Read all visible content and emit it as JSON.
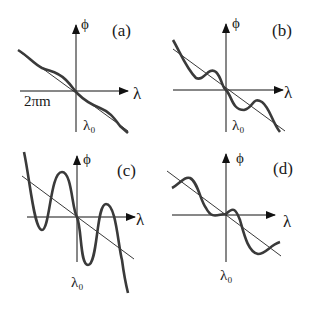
{
  "figure": {
    "panels": [
      {
        "id": "a",
        "tag": "(a)",
        "y_label": "ϕ",
        "x_label": "λ",
        "origin_label": "λ₀",
        "extra_label": "2πm",
        "description": "nearly linear decreasing phase with tiny ripple"
      },
      {
        "id": "b",
        "tag": "(b)",
        "y_label": "ϕ",
        "x_label": "λ",
        "origin_label": "λ₀",
        "description": "decreasing linear trend with moderate oscillation"
      },
      {
        "id": "c",
        "tag": "(c)",
        "y_label": "ϕ",
        "x_label": "λ",
        "origin_label": "λ₀",
        "description": "decreasing linear trend with large-amplitude oscillation"
      },
      {
        "id": "d",
        "tag": "(d)",
        "y_label": "ϕ",
        "x_label": "λ",
        "origin_label": "λ₀",
        "description": "decreasing linear trend with oscillation, flat at ends"
      }
    ],
    "colors": {
      "curve": "#3a3a3a",
      "line": "#1a1a1a",
      "axis": "#111111"
    }
  }
}
